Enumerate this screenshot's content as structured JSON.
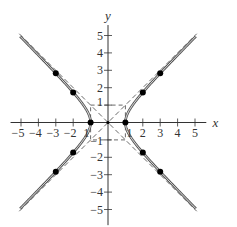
{
  "chart_data": {
    "type": "line",
    "title": "",
    "equation": "x^2 - y^2 = 1",
    "xlabel": "x",
    "ylabel": "y",
    "xlim": [
      -5.5,
      5.5
    ],
    "ylim": [
      -5.5,
      5.5
    ],
    "grid": false,
    "x_ticks": [
      -5,
      -4,
      -3,
      -2,
      -1,
      1,
      2,
      3,
      4,
      5
    ],
    "y_ticks": [
      -5,
      -4,
      -3,
      -2,
      -1,
      1,
      2,
      3,
      4,
      5
    ],
    "x_tick_labels": [
      "−5",
      "−4",
      "−3",
      "−2",
      "1",
      "1",
      "2",
      "3",
      "4",
      "5"
    ],
    "y_tick_labels": [
      "−5",
      "−4",
      "−3",
      "−2",
      "−1",
      "1",
      "2",
      "3",
      "4",
      "5"
    ],
    "asymptotes": [
      {
        "name": "y = x",
        "style": "dashed"
      },
      {
        "name": "y = -x",
        "style": "dashed"
      }
    ],
    "guide_rectangle": {
      "x": [
        -1,
        1
      ],
      "y": [
        -1,
        1
      ],
      "style": "dashed"
    },
    "points": [
      {
        "x": -3,
        "y": 2.83
      },
      {
        "x": -2,
        "y": 1.73
      },
      {
        "x": -1,
        "y": 0
      },
      {
        "x": -2,
        "y": -1.73
      },
      {
        "x": -3,
        "y": -2.83
      },
      {
        "x": 1,
        "y": 0
      },
      {
        "x": 2,
        "y": 1.73
      },
      {
        "x": 3,
        "y": 2.83
      },
      {
        "x": 2,
        "y": -1.73
      },
      {
        "x": 3,
        "y": -2.83
      }
    ],
    "origin_point": {
      "x": 0,
      "y": 0
    },
    "series": [
      {
        "name": "right branch",
        "x_range": [
          1,
          5
        ],
        "style": "solid double"
      },
      {
        "name": "left branch",
        "x_range": [
          -5,
          -1
        ],
        "style": "solid double"
      }
    ],
    "colors": {
      "curve": "#555555",
      "axis": "#333333",
      "dash": "#444444",
      "point": "#000000"
    }
  }
}
